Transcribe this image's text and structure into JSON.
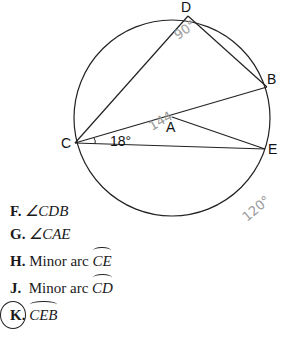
{
  "top_fragment": "...g ...  ...g...",
  "diagram": {
    "points": {
      "D": {
        "label": "D",
        "x": 188,
        "y": 16
      },
      "B": {
        "label": "B",
        "x": 267,
        "y": 87
      },
      "C": {
        "label": "C",
        "x": 75,
        "y": 143
      },
      "E": {
        "label": "E",
        "x": 265,
        "y": 149
      },
      "A": {
        "label": "A",
        "x": 172,
        "y": 117
      }
    },
    "angle_label": "18°",
    "handwritten": {
      "at_D": "90°",
      "at_A": "144",
      "bottom_right": "120°"
    }
  },
  "choices": [
    {
      "letter": "F.",
      "prefix": "∠",
      "text": "CDB",
      "arc": false
    },
    {
      "letter": "G.",
      "prefix": "∠",
      "text": "CAE",
      "arc": false
    },
    {
      "letter": "H.",
      "prefix": "Minor arc ",
      "text": "CE",
      "arc": true
    },
    {
      "letter": "J.",
      "prefix": "Minor arc ",
      "text": "CD",
      "arc": true
    },
    {
      "letter": "K.",
      "prefix": "",
      "text": "CEB",
      "arc": true,
      "circled": true
    }
  ]
}
